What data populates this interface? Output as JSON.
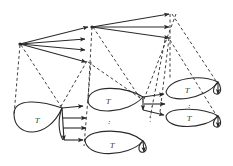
{
  "diagram": {
    "title": "",
    "loop_label": "T",
    "ellipsis": ":",
    "colors": {
      "ink": "#2a2a2a",
      "background": "#ffffff"
    },
    "nodes": [
      {
        "id": "root",
        "role": "top-level source node"
      },
      {
        "id": "level1",
        "role": "second-level node receiving first arrow from root"
      },
      {
        "id": "loop-a",
        "role": "left loop T"
      },
      {
        "id": "loop-b",
        "role": "middle upper loop T"
      },
      {
        "id": "loop-c",
        "role": "middle lower loop T"
      },
      {
        "id": "loop-d",
        "role": "right upper loop T"
      },
      {
        "id": "loop-e",
        "role": "right lower loop T"
      }
    ],
    "edges": [
      {
        "from": "root",
        "to": "level1",
        "style": "solid-arrow"
      },
      {
        "from": "root",
        "to": "branch-2",
        "style": "solid-arrow"
      },
      {
        "from": "root",
        "to": "branch-3",
        "style": "solid-arrow"
      },
      {
        "from": "root",
        "to": "branch-4",
        "style": "solid-arrow"
      },
      {
        "from": "level1",
        "to": "branch-1a",
        "style": "solid-arrow"
      },
      {
        "from": "level1",
        "to": "branch-1b",
        "style": "solid-arrow"
      },
      {
        "from": "level1",
        "to": "branch-1c",
        "style": "solid-arrow"
      },
      {
        "from": "loop-a",
        "to": "loop-b",
        "style": "solid-arrow"
      },
      {
        "from": "loop-a",
        "to": "mid-1",
        "style": "solid-arrow"
      },
      {
        "from": "loop-a",
        "to": "mid-2",
        "style": "solid-arrow"
      },
      {
        "from": "loop-a",
        "to": "loop-c",
        "style": "solid-arrow"
      },
      {
        "from": "loop-b",
        "to": "loop-d",
        "style": "solid-arrow"
      },
      {
        "from": "loop-b",
        "to": "mid-3",
        "style": "solid-arrow"
      },
      {
        "from": "loop-b",
        "to": "loop-e",
        "style": "solid-arrow"
      }
    ]
  }
}
